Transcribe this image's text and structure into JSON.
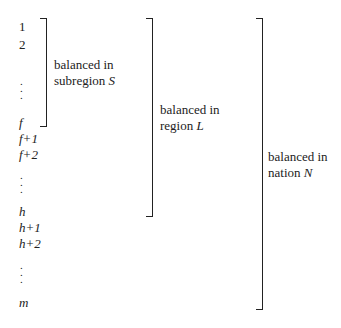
{
  "items": {
    "i1": "1",
    "i2": "2",
    "f": "f",
    "f1": "f+1",
    "f2": "f+2",
    "h": "h",
    "h1": "h+1",
    "h2": "h+2",
    "m": "m",
    "dot": "."
  },
  "brackets": [
    {
      "line1": "balanced in",
      "line2_text": "subregion ",
      "line2_var": "S"
    },
    {
      "line1": "balanced in",
      "line2_text": "region ",
      "line2_var": "L"
    },
    {
      "line1": "balanced in",
      "line2_text": "nation ",
      "line2_var": "N"
    }
  ]
}
